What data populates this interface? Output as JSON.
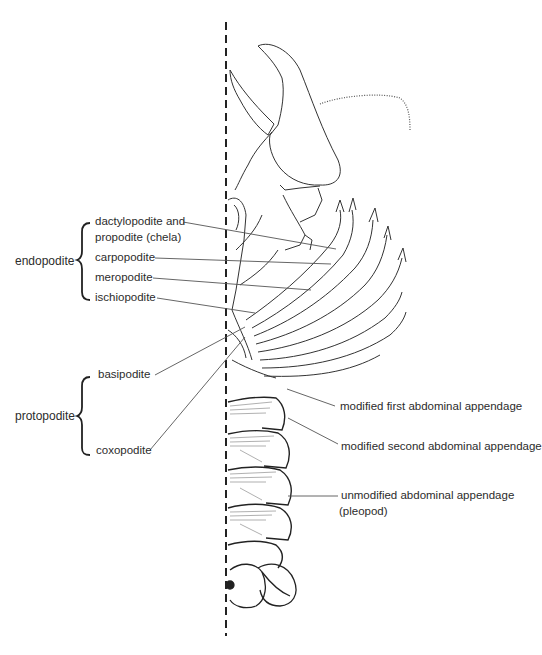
{
  "diagram": {
    "groups": [
      {
        "id": "endopodite",
        "label": "endopodite"
      },
      {
        "id": "protopodite",
        "label": "protopodite"
      }
    ],
    "endopodite_parts": [
      {
        "line1": "dactylopodite and",
        "line2": "propodite (chela)"
      },
      {
        "label": "carpopodite"
      },
      {
        "label": "meropodite"
      },
      {
        "label": "ischiopodite"
      }
    ],
    "protopodite_parts": [
      {
        "label": "basipodite"
      },
      {
        "label": "coxopodite"
      }
    ],
    "abdominal_labels": [
      {
        "label": "modified first abdominal appendage"
      },
      {
        "label": "modified second abdominal appendage"
      },
      {
        "line1": "unmodified abdominal appendage",
        "line2": "(pleopod)"
      }
    ],
    "midline": "dashed vertical axis of symmetry",
    "colors": {
      "ink": "#2a2a2a",
      "background": "#ffffff",
      "leader": "#555555"
    }
  }
}
